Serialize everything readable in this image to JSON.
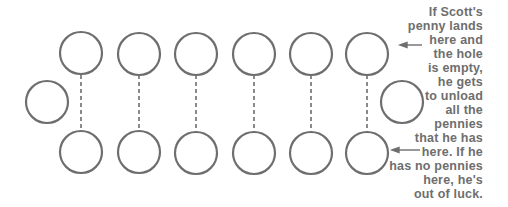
{
  "diagram": {
    "type": "mancala-board",
    "stroke_color": "#6e6e6e",
    "top_row_pits": 6,
    "bottom_row_pits": 6,
    "stores": 2,
    "arrows": [
      {
        "points_to": "top-row-last-pit"
      },
      {
        "points_to": "bottom-row-last-pit"
      }
    ]
  },
  "caption": {
    "lines": [
      "If Scott's",
      "penny lands",
      "here and",
      "the hole",
      "is empty,",
      "he gets",
      "to unload",
      "all the",
      "pennies",
      "that he has",
      "here. If he",
      "has no pennies",
      "here, he's",
      "out of luck."
    ]
  }
}
